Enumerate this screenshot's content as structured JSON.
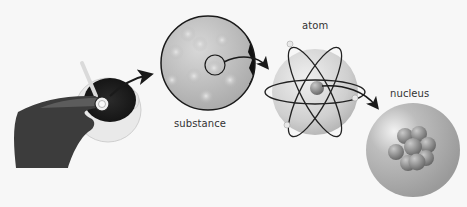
{
  "diagram": {
    "type": "zoom-sequence",
    "stages": [
      {
        "id": "cup",
        "label": "",
        "description": "hand holding a magnifier over a cup of liquid with a spoon"
      },
      {
        "id": "substance",
        "label": "substance"
      },
      {
        "id": "atom",
        "label": "atom"
      },
      {
        "id": "nucleus",
        "label": "nucleus"
      }
    ],
    "arrows": [
      {
        "from": "cup",
        "to": "substance"
      },
      {
        "from": "substance",
        "to": "atom"
      },
      {
        "from": "atom",
        "to": "nucleus"
      }
    ],
    "colors": {
      "background": "#f7f7f7",
      "outline": "#1a1a1a",
      "sphere_light": "#e4e4e4",
      "sphere_dark": "#a8a8a8",
      "nucleon": "#7c7c7c",
      "hand": "#3a3a3a",
      "text": "#333333"
    }
  }
}
